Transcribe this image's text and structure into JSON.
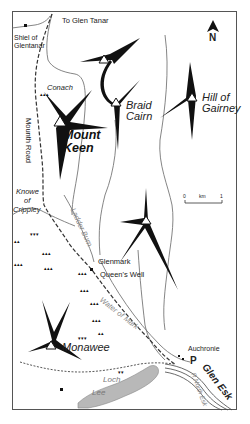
{
  "map": {
    "title": "Mount Keen area map",
    "north_label": "N",
    "scale": {
      "start": "0",
      "unit": "km",
      "end": "1"
    },
    "labels": {
      "to_glen_tanar": "To Glen Tanar",
      "shiel_1": "Shiel of",
      "shiel_2": "Glentanar",
      "conach": "Conach",
      "mounth_road": "Mounth Road",
      "mount": "Mount",
      "keen": "Keen",
      "braid": "Braid",
      "cairn": "Cairn",
      "hill_of": "Hill of",
      "gairney": "Gairney",
      "knowe": "Knowe",
      "of": "of",
      "crippley": "Crippley",
      "ladder_burn": "Ladder Burn",
      "glenmark": "Glenmark",
      "queens_well": "Queen's Well",
      "water_of_mark": "Water of Mark",
      "monawee": "Monawee",
      "auchronie": "Auchronie",
      "parking": "P",
      "glen_esk": "Glen Esk",
      "r_north_esk": "R North Esk",
      "loch": "Loch",
      "lee": "Lee"
    },
    "colors": {
      "ridge": "#111111",
      "track": "#333333",
      "river": "#777777",
      "loch": "#b8b8b8",
      "frame": "#555555"
    }
  }
}
